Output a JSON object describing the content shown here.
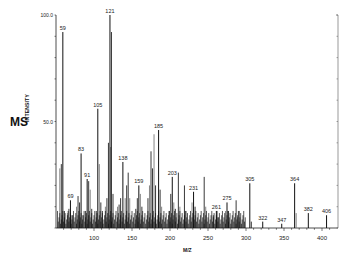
{
  "title": "MS",
  "chart_data": {
    "type": "bar",
    "title": "MS",
    "xlabel": "M/Z",
    "ylabel": "INTENSITY",
    "xlim": [
      50,
      420
    ],
    "ylim": [
      0,
      100
    ],
    "x_ticks": [
      100,
      150,
      200,
      250,
      300,
      350,
      400
    ],
    "y_tick_labels": [
      "50.0",
      "100.0"
    ],
    "grid": false,
    "legend": null,
    "labeled_peaks": [
      {
        "mz": 59,
        "intensity": 92
      },
      {
        "mz": 69,
        "intensity": 13
      },
      {
        "mz": 83,
        "intensity": 35
      },
      {
        "mz": 91,
        "intensity": 23
      },
      {
        "mz": 105,
        "intensity": 56
      },
      {
        "mz": 121,
        "intensity": 100
      },
      {
        "mz": 138,
        "intensity": 31
      },
      {
        "mz": 159,
        "intensity": 20
      },
      {
        "mz": 185,
        "intensity": 46
      },
      {
        "mz": 203,
        "intensity": 24
      },
      {
        "mz": 231,
        "intensity": 17
      },
      {
        "mz": 261,
        "intensity": 8
      },
      {
        "mz": 275,
        "intensity": 12
      },
      {
        "mz": 305,
        "intensity": 21
      },
      {
        "mz": 322,
        "intensity": 3
      },
      {
        "mz": 347,
        "intensity": 2
      },
      {
        "mz": 364,
        "intensity": 21
      },
      {
        "mz": 382,
        "intensity": 7
      },
      {
        "mz": 406,
        "intensity": 6
      }
    ],
    "unlabeled_peaks": [
      {
        "mz": 55,
        "intensity": 28
      },
      {
        "mz": 57,
        "intensity": 30
      },
      {
        "mz": 61,
        "intensity": 8
      },
      {
        "mz": 65,
        "intensity": 7
      },
      {
        "mz": 67,
        "intensity": 9
      },
      {
        "mz": 71,
        "intensity": 6
      },
      {
        "mz": 77,
        "intensity": 10
      },
      {
        "mz": 79,
        "intensity": 15
      },
      {
        "mz": 81,
        "intensity": 12
      },
      {
        "mz": 85,
        "intensity": 6
      },
      {
        "mz": 89,
        "intensity": 8
      },
      {
        "mz": 93,
        "intensity": 22
      },
      {
        "mz": 95,
        "intensity": 18
      },
      {
        "mz": 97,
        "intensity": 9
      },
      {
        "mz": 103,
        "intensity": 8
      },
      {
        "mz": 107,
        "intensity": 30
      },
      {
        "mz": 109,
        "intensity": 12
      },
      {
        "mz": 111,
        "intensity": 8
      },
      {
        "mz": 115,
        "intensity": 10
      },
      {
        "mz": 117,
        "intensity": 14
      },
      {
        "mz": 119,
        "intensity": 40
      },
      {
        "mz": 122,
        "intensity": 38
      },
      {
        "mz": 123,
        "intensity": 92
      },
      {
        "mz": 125,
        "intensity": 16
      },
      {
        "mz": 131,
        "intensity": 10
      },
      {
        "mz": 133,
        "intensity": 11
      },
      {
        "mz": 135,
        "intensity": 14
      },
      {
        "mz": 141,
        "intensity": 14
      },
      {
        "mz": 143,
        "intensity": 20
      },
      {
        "mz": 145,
        "intensity": 26
      },
      {
        "mz": 147,
        "intensity": 14
      },
      {
        "mz": 155,
        "intensity": 9
      },
      {
        "mz": 157,
        "intensity": 14
      },
      {
        "mz": 161,
        "intensity": 16
      },
      {
        "mz": 163,
        "intensity": 10
      },
      {
        "mz": 171,
        "intensity": 14
      },
      {
        "mz": 173,
        "intensity": 20
      },
      {
        "mz": 175,
        "intensity": 36
      },
      {
        "mz": 177,
        "intensity": 28
      },
      {
        "mz": 179,
        "intensity": 44
      },
      {
        "mz": 181,
        "intensity": 20
      },
      {
        "mz": 187,
        "intensity": 18
      },
      {
        "mz": 189,
        "intensity": 10
      },
      {
        "mz": 199,
        "intensity": 8
      },
      {
        "mz": 201,
        "intensity": 16
      },
      {
        "mz": 205,
        "intensity": 12
      },
      {
        "mz": 207,
        "intensity": 9
      },
      {
        "mz": 211,
        "intensity": 26
      },
      {
        "mz": 213,
        "intensity": 10
      },
      {
        "mz": 219,
        "intensity": 20
      },
      {
        "mz": 221,
        "intensity": 8
      },
      {
        "mz": 229,
        "intensity": 12
      },
      {
        "mz": 233,
        "intensity": 10
      },
      {
        "mz": 245,
        "intensity": 24
      },
      {
        "mz": 247,
        "intensity": 10
      },
      {
        "mz": 257,
        "intensity": 6
      },
      {
        "mz": 263,
        "intensity": 5
      },
      {
        "mz": 273,
        "intensity": 8
      },
      {
        "mz": 277,
        "intensity": 8
      },
      {
        "mz": 287,
        "intensity": 13
      },
      {
        "mz": 289,
        "intensity": 5
      },
      {
        "mz": 291,
        "intensity": 8
      },
      {
        "mz": 307,
        "intensity": 3
      },
      {
        "mz": 366,
        "intensity": 7
      }
    ]
  }
}
